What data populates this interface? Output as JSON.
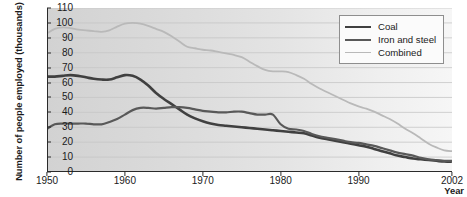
{
  "chart_data": {
    "type": "line",
    "title": "",
    "xlabel": "Year",
    "ylabel": "Number of people employed (thousands)",
    "xlim": [
      1950,
      2002
    ],
    "ylim": [
      0,
      110
    ],
    "grid": true,
    "legend_position": "top-right",
    "x_ticks": [
      1950,
      1960,
      1970,
      1980,
      1990,
      2002
    ],
    "x_tick_labels": [
      "1950",
      "1960",
      "1970",
      "1980",
      "1990",
      "2002"
    ],
    "y_ticks": [
      0,
      10,
      20,
      30,
      40,
      50,
      60,
      70,
      80,
      90,
      100,
      110
    ],
    "y_tick_labels": [
      "0",
      "10",
      "20",
      "30",
      "40",
      "50",
      "60",
      "70",
      "80",
      "90",
      "100",
      "110"
    ],
    "x": [
      1950,
      1951,
      1952,
      1953,
      1954,
      1955,
      1956,
      1957,
      1958,
      1959,
      1960,
      1961,
      1962,
      1963,
      1964,
      1965,
      1966,
      1967,
      1968,
      1969,
      1970,
      1971,
      1972,
      1973,
      1974,
      1975,
      1976,
      1977,
      1978,
      1979,
      1980,
      1981,
      1982,
      1983,
      1984,
      1985,
      1986,
      1987,
      1988,
      1989,
      1990,
      1991,
      1992,
      1993,
      1994,
      1995,
      1996,
      1997,
      1998,
      1999,
      2000,
      2001,
      2002
    ],
    "series": [
      {
        "name": "Coal",
        "color": "#404040",
        "width": 2.6,
        "values": [
          64,
          64,
          64.5,
          65,
          64.5,
          63.5,
          62.5,
          62,
          62,
          63.5,
          65,
          64.5,
          62,
          58,
          53,
          49,
          45.5,
          42,
          38.5,
          36,
          34,
          32.5,
          31.5,
          31,
          30.5,
          30,
          29.5,
          29,
          28.5,
          28,
          27.5,
          27,
          26.5,
          26,
          24.5,
          23,
          22,
          21,
          20,
          19,
          18,
          17,
          15.5,
          14,
          12.5,
          11,
          10,
          9,
          8.5,
          8,
          7.5,
          7,
          7
        ]
      },
      {
        "name": "Iron and steel",
        "color": "#595959",
        "width": 2.2,
        "values": [
          29,
          32,
          32.5,
          32.5,
          32.5,
          32.5,
          32,
          32,
          33.5,
          35.5,
          38.5,
          41.5,
          43,
          43,
          42.5,
          43,
          43.5,
          43.5,
          43,
          42,
          41,
          40.5,
          40,
          40,
          40.5,
          40.5,
          39.5,
          38.5,
          38.5,
          38.5,
          32,
          29,
          28.5,
          27.5,
          25.5,
          24,
          23,
          22,
          21,
          20,
          19.5,
          18.5,
          17.5,
          16,
          14.5,
          13,
          12,
          11,
          9.5,
          8.5,
          8,
          7.5,
          7.5
        ]
      },
      {
        "name": "Combined",
        "color": "#b9b9b9",
        "width": 1.8,
        "values": [
          93,
          96,
          97,
          96.5,
          95.5,
          95,
          94.5,
          94,
          95,
          97.5,
          99.5,
          100,
          99.5,
          98,
          96,
          94,
          91,
          87.5,
          84,
          83,
          82,
          81.5,
          80.5,
          79.5,
          78.5,
          77,
          74,
          71,
          68.5,
          67.5,
          67.5,
          67,
          65,
          62.5,
          59,
          56,
          53.5,
          51,
          48.5,
          46,
          44,
          42.5,
          40.5,
          38,
          35.5,
          32.5,
          29,
          26,
          22.5,
          19,
          16.5,
          14.5,
          14
        ]
      }
    ]
  },
  "legend": {
    "entries": [
      {
        "label": "Coal"
      },
      {
        "label": "Iron and steel"
      },
      {
        "label": "Combined"
      }
    ]
  }
}
